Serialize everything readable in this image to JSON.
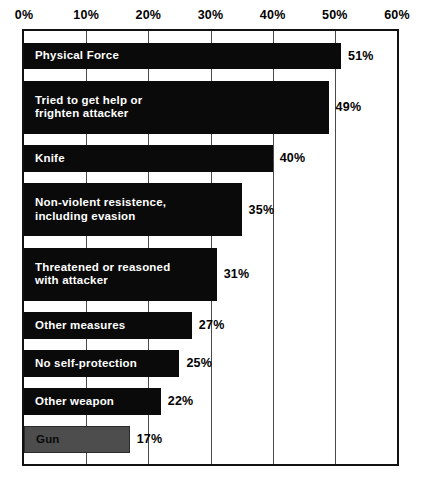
{
  "chart_data": {
    "type": "bar",
    "orientation": "horizontal",
    "title": "",
    "subtitle": "",
    "xlabel": "",
    "ylabel": "",
    "xlim": [
      0,
      60
    ],
    "grid": true,
    "legend": false,
    "axis_position": "top",
    "tick_labels": [
      "0%",
      "10%",
      "20%",
      "30%",
      "40%",
      "50%",
      "60%"
    ],
    "tick_values": [
      0,
      10,
      20,
      30,
      40,
      50,
      60
    ],
    "value_suffix": "%",
    "categories": [
      "Physical Force",
      "Tried to get help or\nfrighten attacker",
      "Knife",
      "Non-violent resistence,\nincluding evasion",
      "Threatened or reasoned\nwith attacker",
      "Other measures",
      "No self-protection",
      "Other weapon",
      "Gun"
    ],
    "values": [
      51,
      49,
      40,
      35,
      31,
      27,
      25,
      22,
      17
    ],
    "value_labels": [
      "51%",
      "49%",
      "40%",
      "35%",
      "31%",
      "27%",
      "25%",
      "22%",
      "17%"
    ],
    "bars": [
      {
        "label": "Physical Force",
        "value": 51,
        "value_label": "51%",
        "lines": 1,
        "style": "black"
      },
      {
        "label": "Tried to get help or\nfrighten attacker",
        "value": 49,
        "value_label": "49%",
        "lines": 2,
        "style": "black"
      },
      {
        "label": "Knife",
        "value": 40,
        "value_label": "40%",
        "lines": 1,
        "style": "black"
      },
      {
        "label": "Non-violent resistence,\nincluding evasion",
        "value": 35,
        "value_label": "35%",
        "lines": 2,
        "style": "black"
      },
      {
        "label": "Threatened or reasoned\nwith attacker",
        "value": 31,
        "value_label": "31%",
        "lines": 2,
        "style": "black"
      },
      {
        "label": "Other measures",
        "value": 27,
        "value_label": "27%",
        "lines": 1,
        "style": "black"
      },
      {
        "label": "No self-protection",
        "value": 25,
        "value_label": "25%",
        "lines": 1,
        "style": "black"
      },
      {
        "label": "Other weapon",
        "value": 22,
        "value_label": "22%",
        "lines": 1,
        "style": "black"
      },
      {
        "label": "Gun",
        "value": 17,
        "value_label": "17%",
        "lines": 1,
        "style": "gray"
      }
    ],
    "colors": {
      "bar_black": "#0a0a0a",
      "bar_gray": "#4d4d4d",
      "bar_label_on_black": "#ffffff",
      "bar_label_on_gray": "#0a0a0a",
      "value_label": "#000000",
      "gridline": "#4a4a4a",
      "plot_border": "#111111",
      "background": "#ffffff"
    }
  }
}
